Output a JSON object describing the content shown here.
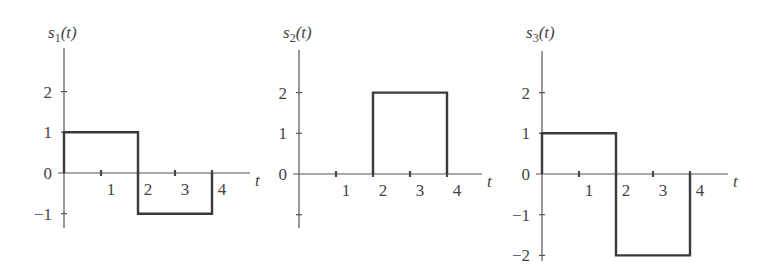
{
  "chart_data": [
    {
      "type": "line",
      "title": "",
      "ylabel": "s1(t)",
      "ylabel_base": "s",
      "ylabel_sub": "1",
      "ylabel_arg": "(t)",
      "xlabel": "t",
      "x_ticks": [
        1,
        2,
        3,
        4
      ],
      "x_tick_labels": [
        "1",
        "2",
        "3",
        "4"
      ],
      "y_ticks": [
        2,
        1,
        0,
        -1
      ],
      "y_tick_labels": [
        "2",
        "1",
        "0",
        "−1"
      ],
      "ylim": [
        -1.3,
        3.0
      ],
      "xlim": [
        0,
        5
      ],
      "grid": false,
      "segments": [
        {
          "t_start": 0,
          "t_end": 2,
          "value": 1
        },
        {
          "t_start": 2,
          "t_end": 4,
          "value": -1
        }
      ],
      "x": [
        0,
        0,
        2,
        2,
        4,
        4
      ],
      "y": [
        0,
        1,
        1,
        -1,
        -1,
        0
      ]
    },
    {
      "type": "line",
      "title": "",
      "ylabel": "s2(t)",
      "ylabel_base": "s",
      "ylabel_sub": "2",
      "ylabel_arg": "(t)",
      "xlabel": "t",
      "x_ticks": [
        1,
        2,
        3,
        4
      ],
      "x_tick_labels": [
        "1",
        "2",
        "3",
        "4"
      ],
      "y_ticks": [
        2,
        1,
        0,
        -1
      ],
      "y_tick_labels": [
        "2",
        "1",
        "0",
        ""
      ],
      "ylim": [
        -1.3,
        3.0
      ],
      "xlim": [
        0,
        5
      ],
      "grid": false,
      "segments": [
        {
          "t_start": 0,
          "t_end": 2,
          "value": 0
        },
        {
          "t_start": 2,
          "t_end": 4,
          "value": 2
        }
      ],
      "x": [
        2,
        2,
        4,
        4
      ],
      "y": [
        0,
        2,
        2,
        0
      ]
    },
    {
      "type": "line",
      "title": "",
      "ylabel": "s3(t)",
      "ylabel_base": "s",
      "ylabel_sub": "3",
      "ylabel_arg": "(t)",
      "xlabel": "t",
      "x_ticks": [
        1,
        2,
        3,
        4
      ],
      "x_tick_labels": [
        "1",
        "2",
        "3",
        "4"
      ],
      "y_ticks": [
        2,
        1,
        0,
        -1,
        -2
      ],
      "y_tick_labels": [
        "2",
        "1",
        "0",
        "−1",
        "−2"
      ],
      "ylim": [
        -2.1,
        3.0
      ],
      "xlim": [
        0,
        5
      ],
      "grid": false,
      "segments": [
        {
          "t_start": 0,
          "t_end": 2,
          "value": 1
        },
        {
          "t_start": 2,
          "t_end": 4,
          "value": -2
        }
      ],
      "x": [
        0,
        0,
        2,
        2,
        4,
        4
      ],
      "y": [
        0,
        1,
        1,
        -2,
        -2,
        0
      ]
    }
  ]
}
